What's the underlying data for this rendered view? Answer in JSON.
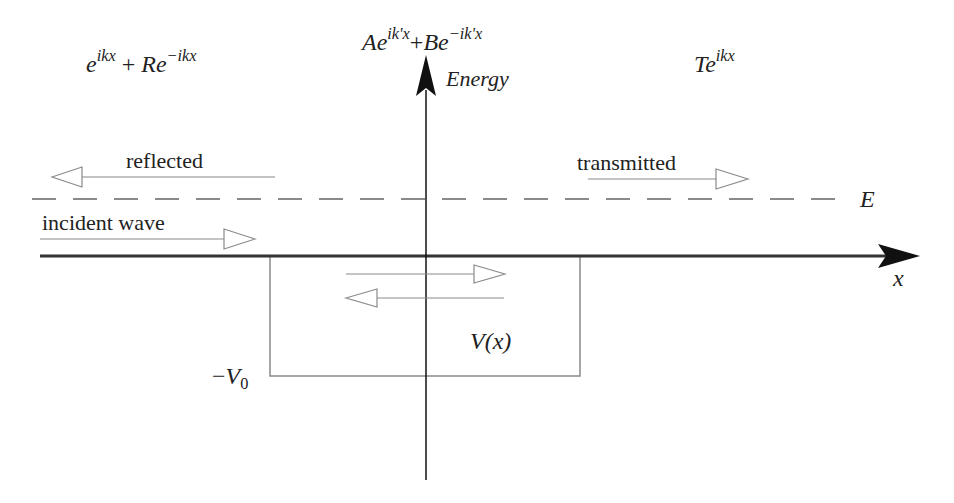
{
  "diagram": {
    "type": "quantum-square-well-scattering",
    "region_left": {
      "wavefunction": {
        "base": "e",
        "exp1": "ikx",
        "plus": "+",
        "coef": "R",
        "base2": "e",
        "exp2": "−ikx"
      }
    },
    "region_middle": {
      "wavefunction": {
        "coefA": "A",
        "base": "e",
        "exp1": "ik'x",
        "plus": "+",
        "coefB": "B",
        "base2": "e",
        "exp2": "−ik'x"
      }
    },
    "region_right": {
      "wavefunction": {
        "coef": "T",
        "base": "e",
        "exp1": "ikx"
      }
    },
    "axes": {
      "y_label": "Energy",
      "x_label": "x"
    },
    "energy_level_label": "E",
    "arrows": {
      "reflected": "reflected",
      "incident": "incident wave",
      "transmitted": "transmitted"
    },
    "potential": {
      "label": "V(x)",
      "depth_label_sign": "−",
      "depth_label_var": "V",
      "depth_label_sub": "0"
    },
    "colors": {
      "axis": "#111111",
      "thin_lines": "#8a8a8a",
      "dashed": "#8a8a8a",
      "text": "#222222"
    }
  }
}
